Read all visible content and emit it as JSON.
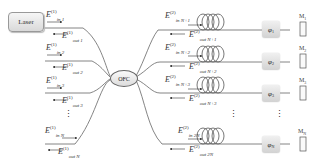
{
  "laser": {
    "label": "Laser"
  },
  "coupler": {
    "label": "OFC"
  },
  "left_ports": [
    {
      "in_base": "E",
      "in_sup": "(1)",
      "in_sub": "in 1",
      "out_base": "E",
      "out_sup": "(1)",
      "out_sub": "out 1"
    },
    {
      "in_base": "E",
      "in_sup": "(1)",
      "in_sub": "in 2",
      "out_base": "E",
      "out_sup": "(1)",
      "out_sub": "out 2"
    },
    {
      "in_base": "E",
      "in_sup": "(1)",
      "in_sub": "in 3",
      "out_base": "E",
      "out_sup": "(1)",
      "out_sub": "out 3"
    },
    {
      "in_base": "E",
      "in_sup": "(1)",
      "in_sub": "in N",
      "out_base": "E",
      "out_sup": "(1)",
      "out_sub": "out N"
    }
  ],
  "right_ports": [
    {
      "in_base": "E",
      "in_sup": "(2)",
      "in_sub": "in N+1",
      "out_base": "E",
      "out_sup": "(2)",
      "out_sub": "out N+1",
      "phase_base": "φ",
      "phase_sub": "1",
      "mirror_base": "M",
      "mirror_sub": "1"
    },
    {
      "in_base": "E",
      "in_sup": "(2)",
      "in_sub": "in N+2",
      "out_base": "E",
      "out_sup": "(2)",
      "out_sub": "out N+2",
      "phase_base": "φ",
      "phase_sub": "2",
      "mirror_base": "M",
      "mirror_sub": "2"
    },
    {
      "in_base": "E",
      "in_sup": "(2)",
      "in_sub": "in N+3",
      "out_base": "E",
      "out_sup": "(2)",
      "out_sub": "out N+3",
      "phase_base": "φ",
      "phase_sub": "3",
      "mirror_base": "M",
      "mirror_sub": "3"
    },
    {
      "in_base": "E",
      "in_sup": "(2)",
      "in_sub": "in 2N",
      "out_base": "E",
      "out_sup": "(2)",
      "out_sub": "out 2N",
      "phase_base": "φ",
      "phase_sub": "N",
      "mirror_base": "M",
      "mirror_sub": "N"
    }
  ],
  "ellipsis": "⋮"
}
